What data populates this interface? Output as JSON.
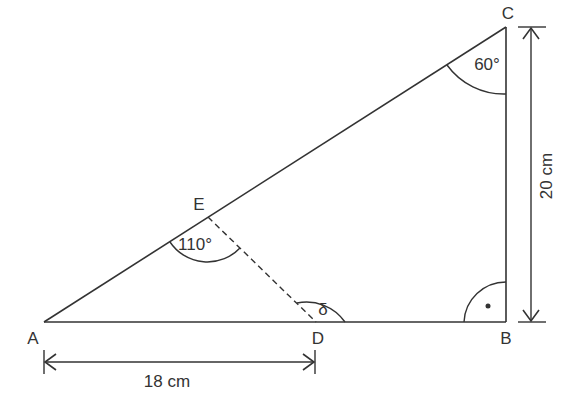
{
  "diagram": {
    "type": "geometry-triangle",
    "stroke_color": "#333333",
    "points": {
      "A": {
        "label": "A"
      },
      "B": {
        "label": "B"
      },
      "C": {
        "label": "C"
      },
      "D": {
        "label": "D"
      },
      "E": {
        "label": "E"
      }
    },
    "angles": {
      "C": {
        "label": "60°"
      },
      "E": {
        "label": "110°"
      },
      "D": {
        "label": "δ"
      },
      "B": {
        "label": "right-angle",
        "marker": "•"
      }
    },
    "dimensions": {
      "AD": {
        "label": "18 cm"
      },
      "BC": {
        "label": "20 cm"
      }
    },
    "segments": [
      {
        "from": "A",
        "to": "B",
        "style": "solid"
      },
      {
        "from": "B",
        "to": "C",
        "style": "solid"
      },
      {
        "from": "A",
        "to": "C",
        "style": "solid"
      },
      {
        "from": "E",
        "to": "D",
        "style": "dashed"
      }
    ]
  }
}
